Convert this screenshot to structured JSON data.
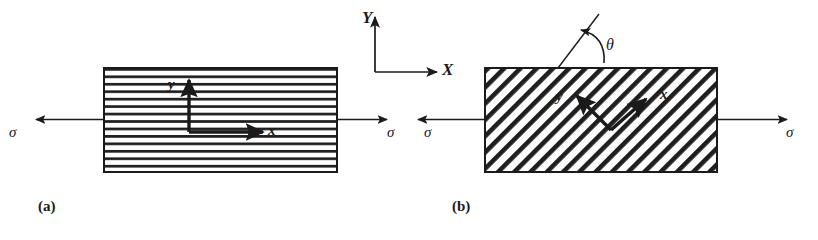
{
  "figure": {
    "title_global_axes": {
      "x_axis_label": "X",
      "y_axis_label": "Y"
    },
    "background_color": "#ffffff",
    "line_color": "#1a1a1a",
    "panels": [
      {
        "caption": "(a)",
        "fiber_orientation_deg": 0,
        "hatch_style": "horizontal",
        "local_axes": {
          "x_label": "x",
          "y_label": "y"
        },
        "load_labels": {
          "left": "σ",
          "right": "σ"
        },
        "rect": {
          "x": 104,
          "y": 68,
          "width": 233,
          "height": 104
        }
      },
      {
        "caption": "(b)",
        "fiber_orientation_deg": 45,
        "hatch_style": "diagonal-45",
        "local_axes": {
          "x_label": "x",
          "y_label": "y"
        },
        "angle_label": "θ",
        "load_labels": {
          "left": "σ",
          "right": "σ"
        },
        "rect": {
          "x": 485,
          "y": 68,
          "width": 232,
          "height": 104
        }
      }
    ]
  }
}
